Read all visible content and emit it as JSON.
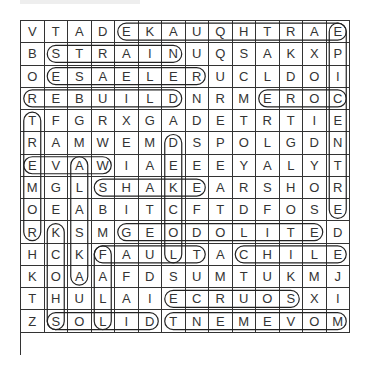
{
  "puzzle": {
    "cols": 14,
    "rows": 15,
    "grid": [
      [
        "V",
        "T",
        "A",
        "D",
        "E",
        "K",
        "A",
        "U",
        "Q",
        "H",
        "T",
        "R",
        "A",
        "E"
      ],
      [
        "B",
        "S",
        "T",
        "R",
        "A",
        "I",
        "N",
        "U",
        "Q",
        "S",
        "A",
        "K",
        "X",
        "P"
      ],
      [
        "O",
        "E",
        "S",
        "A",
        "E",
        "L",
        "E",
        "R",
        "U",
        "C",
        "L",
        "D",
        "O",
        "I"
      ],
      [
        "R",
        "E",
        "B",
        "U",
        "I",
        "L",
        "D",
        "N",
        "R",
        "M",
        "E",
        "R",
        "O",
        "C"
      ],
      [
        "T",
        "F",
        "G",
        "R",
        "X",
        "G",
        "A",
        "D",
        "E",
        "T",
        "R",
        "T",
        "I",
        "E"
      ],
      [
        "R",
        "A",
        "M",
        "W",
        "E",
        "M",
        "D",
        "S",
        "P",
        "O",
        "L",
        "G",
        "D",
        "N"
      ],
      [
        "E",
        "V",
        "A",
        "W",
        "I",
        "A",
        "E",
        "E",
        "E",
        "Y",
        "A",
        "L",
        "Y",
        "T"
      ],
      [
        "M",
        "G",
        "L",
        "S",
        "H",
        "A",
        "K",
        "E",
        "A",
        "R",
        "S",
        "H",
        "O",
        "R"
      ],
      [
        "O",
        "E",
        "A",
        "B",
        "I",
        "T",
        "C",
        "F",
        "T",
        "D",
        "F",
        "O",
        "S",
        "E"
      ],
      [
        "R",
        "K",
        "S",
        "M",
        "G",
        "E",
        "O",
        "D",
        "O",
        "L",
        "I",
        "T",
        "E",
        "D"
      ],
      [
        "H",
        "C",
        "K",
        "F",
        "A",
        "U",
        "L",
        "T",
        "A",
        "C",
        "H",
        "I",
        "L",
        "E"
      ],
      [
        "K",
        "O",
        "A",
        "A",
        "F",
        "D",
        "S",
        "U",
        "M",
        "T",
        "U",
        "K",
        "M",
        "J"
      ],
      [
        "T",
        "H",
        "U",
        "L",
        "A",
        "I",
        "E",
        "C",
        "R",
        "U",
        "O",
        "S",
        "X",
        "I"
      ],
      [
        "Z",
        "S",
        "O",
        "L",
        "I",
        "D",
        "T",
        "N",
        "E",
        "M",
        "E",
        "V",
        "O",
        "M"
      ]
    ],
    "found_words": [
      {
        "word": "EARTHQUAKE",
        "start": [
          0,
          13
        ],
        "end": [
          0,
          4
        ]
      },
      {
        "word": "STRAIN",
        "start": [
          1,
          1
        ],
        "end": [
          1,
          6
        ]
      },
      {
        "word": "RELEASE",
        "start": [
          2,
          7
        ],
        "end": [
          2,
          1
        ]
      },
      {
        "word": "REBUILD",
        "start": [
          3,
          0
        ],
        "end": [
          3,
          6
        ]
      },
      {
        "word": "CORE",
        "start": [
          3,
          13
        ],
        "end": [
          3,
          10
        ]
      },
      {
        "word": "WAVE",
        "start": [
          6,
          3
        ],
        "end": [
          6,
          0
        ]
      },
      {
        "word": "SHAKE",
        "start": [
          7,
          3
        ],
        "end": [
          7,
          7
        ]
      },
      {
        "word": "GEODOLITE",
        "start": [
          9,
          4
        ],
        "end": [
          9,
          12
        ]
      },
      {
        "word": "FAULT",
        "start": [
          10,
          3
        ],
        "end": [
          10,
          7
        ]
      },
      {
        "word": "CHILE",
        "start": [
          10,
          9
        ],
        "end": [
          10,
          13
        ]
      },
      {
        "word": "SOURCE",
        "start": [
          12,
          11
        ],
        "end": [
          12,
          6
        ]
      },
      {
        "word": "SOLID",
        "start": [
          13,
          1
        ],
        "end": [
          13,
          5
        ]
      },
      {
        "word": "MOVEMENT",
        "start": [
          13,
          13
        ],
        "end": [
          13,
          6
        ]
      },
      {
        "word": "EPICENTRE",
        "start": [
          0,
          13
        ],
        "end": [
          8,
          13
        ]
      },
      {
        "word": "TREMOR",
        "start": [
          4,
          0
        ],
        "end": [
          9,
          0
        ]
      },
      {
        "word": "SHOCK",
        "start": [
          13,
          1
        ],
        "end": [
          9,
          1
        ]
      },
      {
        "word": "ALASKA",
        "start": [
          6,
          2
        ],
        "end": [
          11,
          2
        ]
      },
      {
        "word": "FALL",
        "start": [
          10,
          3
        ],
        "end": [
          13,
          3
        ]
      },
      {
        "word": "LOCKED",
        "start": [
          10,
          6
        ],
        "end": [
          5,
          6
        ]
      }
    ]
  }
}
